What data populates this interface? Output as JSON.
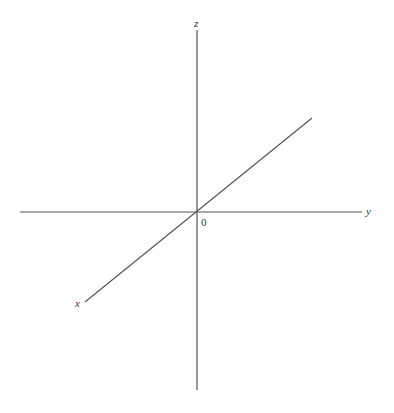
{
  "diagram": {
    "axes": {
      "x": {
        "label": "x",
        "from": [
          85,
          302
        ],
        "to": [
          312,
          118
        ]
      },
      "y": {
        "label": "y",
        "from": [
          20,
          212
        ],
        "to": [
          362,
          212
        ]
      },
      "z": {
        "label": "z",
        "from": [
          197,
          30
        ],
        "to": [
          197,
          390
        ]
      }
    },
    "origin": {
      "label": "0",
      "position": [
        197,
        212
      ]
    },
    "colors": {
      "line": "#555555",
      "text": "#333333",
      "background": "#ffffff"
    }
  }
}
